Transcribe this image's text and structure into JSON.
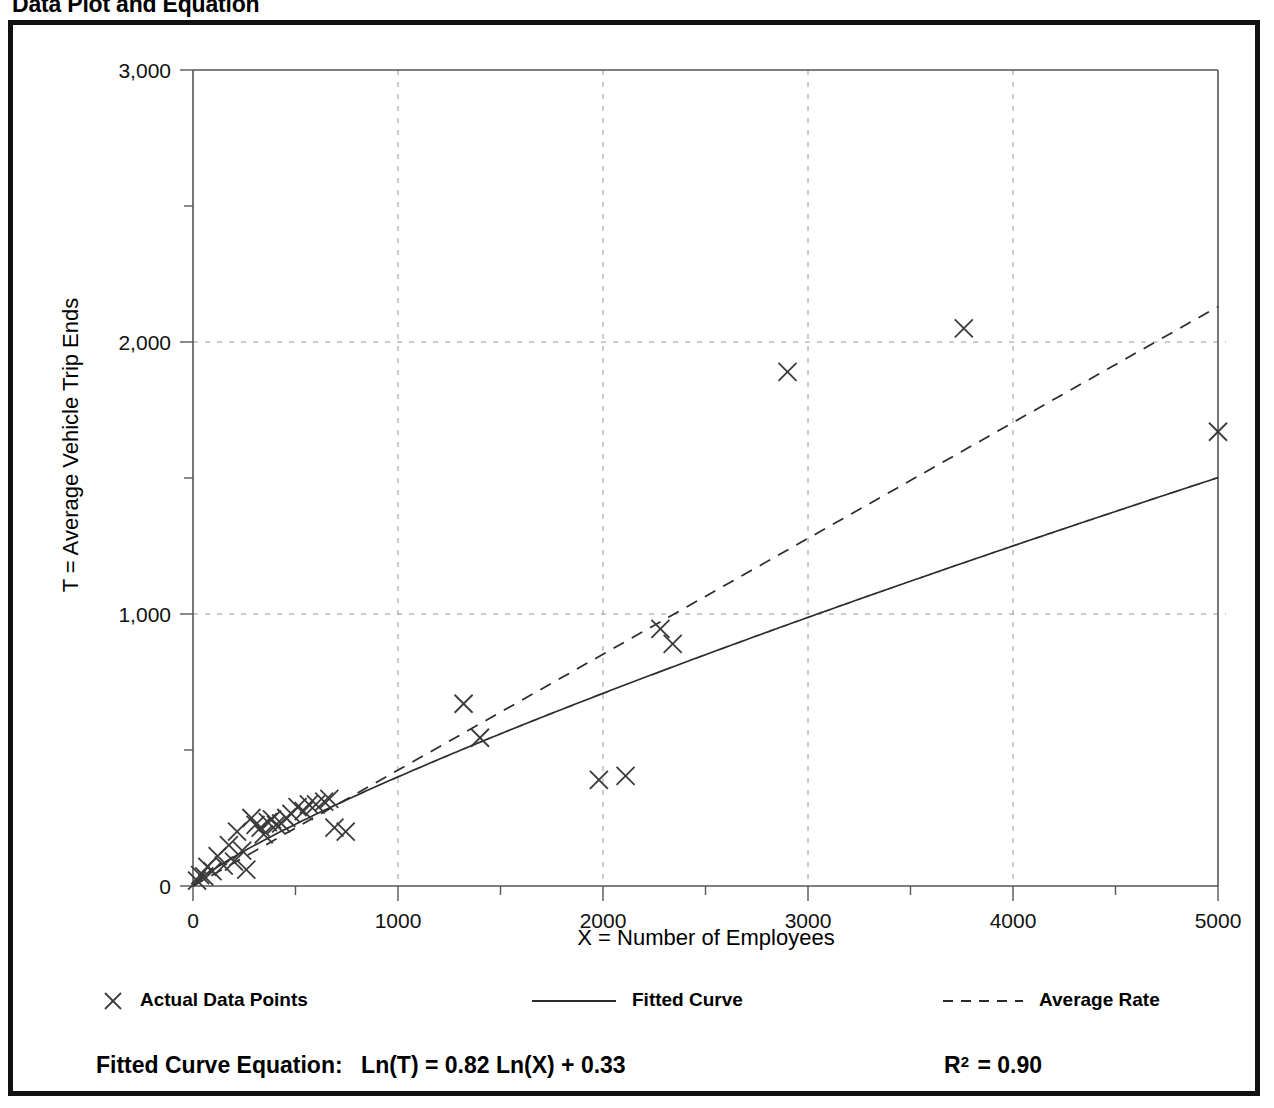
{
  "page_title": "Data Plot and Equation",
  "chart_data": {
    "type": "scatter",
    "title": "Data Plot and Equation",
    "xlabel": "X = Number of Employees",
    "ylabel": "T = Average Vehicle Trip Ends",
    "xlim": [
      0,
      5000
    ],
    "ylim": [
      0,
      3000
    ],
    "grid": true,
    "x_ticks": [
      0,
      1000,
      2000,
      3000,
      4000,
      5000
    ],
    "x_tick_labels": [
      "0",
      "1000",
      "2000",
      "3000",
      "4000",
      "5000"
    ],
    "x_minor_ticks": [
      500,
      1500,
      2500,
      3500,
      4500
    ],
    "y_ticks": [
      0,
      1000,
      2000,
      3000
    ],
    "y_tick_labels": [
      "0",
      "1,000",
      "2,000",
      "3,000"
    ],
    "y_minor_ticks": [
      500,
      1500,
      2500
    ],
    "legend_position": "below-axis",
    "series": [
      {
        "name": "Actual Data Points",
        "type": "scatter",
        "marker": "x",
        "points": [
          [
            20,
            20
          ],
          [
            35,
            40
          ],
          [
            55,
            35
          ],
          [
            70,
            70
          ],
          [
            95,
            55
          ],
          [
            120,
            110
          ],
          [
            150,
            75
          ],
          [
            175,
            150
          ],
          [
            200,
            90
          ],
          [
            215,
            200
          ],
          [
            240,
            130
          ],
          [
            260,
            60
          ],
          [
            285,
            250
          ],
          [
            305,
            225
          ],
          [
            330,
            215
          ],
          [
            345,
            190
          ],
          [
            365,
            235
          ],
          [
            385,
            245
          ],
          [
            405,
            225
          ],
          [
            430,
            230
          ],
          [
            455,
            250
          ],
          [
            480,
            265
          ],
          [
            510,
            290
          ],
          [
            540,
            275
          ],
          [
            565,
            300
          ],
          [
            600,
            300
          ],
          [
            640,
            310
          ],
          [
            665,
            320
          ],
          [
            690,
            215
          ],
          [
            745,
            200
          ],
          [
            1320,
            670
          ],
          [
            1400,
            545
          ],
          [
            1980,
            390
          ],
          [
            2110,
            405
          ],
          [
            2280,
            945
          ],
          [
            2340,
            890
          ],
          [
            2900,
            1890
          ],
          [
            3760,
            2050
          ],
          [
            5000,
            1670
          ]
        ]
      },
      {
        "name": "Fitted Curve",
        "type": "line",
        "style": "solid",
        "equation": "Ln(T) = 0.82 Ln(X) + 0.33",
        "slope": 0.82,
        "intercept": 0.33
      },
      {
        "name": "Average Rate",
        "type": "line",
        "style": "dashed",
        "through_origin": true,
        "value_at_5000": 2130
      }
    ],
    "annotations": {
      "equation_label": "Fitted Curve Equation:",
      "equation": "Ln(T) = 0.82 Ln(X) + 0.33",
      "r_squared_label": "R",
      "r_squared_exponent": "2",
      "r_squared_value": "= 0.90",
      "r_squared_full": "R2 = 0.90"
    }
  },
  "legend": {
    "items": [
      {
        "label": "Actual Data Points",
        "marker": "x-marker"
      },
      {
        "label": "Fitted Curve",
        "marker": "solid-line"
      },
      {
        "label": "Average Rate",
        "marker": "dashed-line"
      }
    ]
  },
  "colors": {
    "frame": "#111111",
    "axis": "#555555",
    "grid": "#9a9a9a",
    "data": "#3a3a3a",
    "background": "#ffffff"
  }
}
